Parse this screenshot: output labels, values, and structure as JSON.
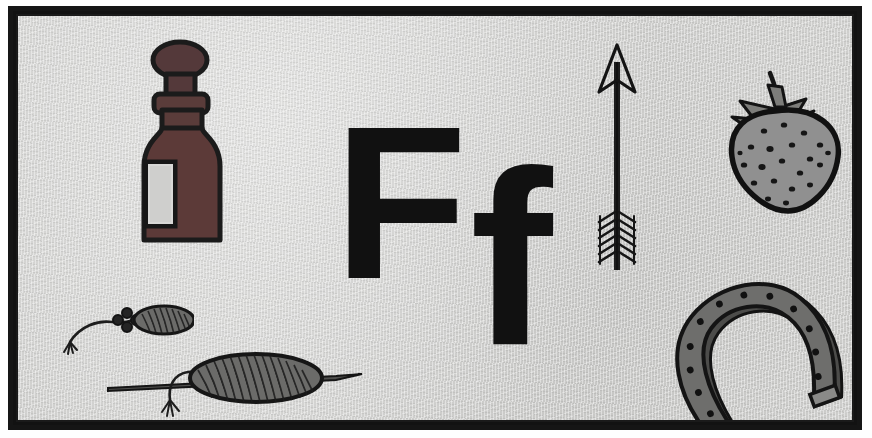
{
  "page": {
    "kind": "alphabet-flashcard",
    "letter_upper": "F",
    "letter_lower": "f",
    "background_color": "#cfcfcd",
    "frame_color": "#151515",
    "ink_color": "#111111"
  },
  "letters": {
    "uppercase": "F",
    "lowercase": "f"
  },
  "illustrations": [
    {
      "id": "flask",
      "name": "flask",
      "label": "flask",
      "position": "top-left",
      "colors": {
        "body": "#5c3a38",
        "outline": "#1b1b1b",
        "label_patch": "#cfcfcd"
      }
    },
    {
      "id": "arrow",
      "name": "arrow",
      "label": "fletched arrow",
      "position": "top-center-right",
      "colors": {
        "outline": "#1b1b1b",
        "fill": "#2a2a2a"
      }
    },
    {
      "id": "strawberry",
      "name": "strawberry",
      "label": "fruit (strawberry)",
      "position": "top-right",
      "colors": {
        "body": "#8f8f8d",
        "outline": "#111111",
        "leaves": "#7d7d7a",
        "seeds": "#151515"
      }
    },
    {
      "id": "horseshoe",
      "name": "horseshoe",
      "label": "farrier horseshoe",
      "position": "bottom-right",
      "colors": {
        "body": "#6e6e6c",
        "outline": "#141414",
        "holes": "#121212"
      }
    },
    {
      "id": "spindle-small",
      "name": "spindle-small",
      "label": "flax spindle (small)",
      "position": "bottom-left",
      "colors": {
        "body": "#646462",
        "outline": "#161616",
        "thread": "#1d1d1d"
      }
    },
    {
      "id": "spindle-large",
      "name": "spindle-large",
      "label": "flax spindle (large)",
      "position": "bottom-left-center",
      "colors": {
        "body": "#646462",
        "outline": "#161616",
        "thread": "#1d1d1d"
      }
    }
  ]
}
